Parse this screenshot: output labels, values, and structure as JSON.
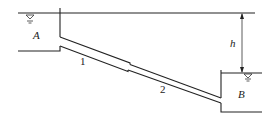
{
  "diagram": {
    "type": "hydraulics-pipe-system",
    "reservoir_upper": {
      "label": "A"
    },
    "reservoir_lower": {
      "label": "B"
    },
    "pipe_segments": [
      {
        "label": "1"
      },
      {
        "label": "2"
      }
    ],
    "head_difference": {
      "label": "h"
    },
    "water_surface_symbol": "▽",
    "colors": {
      "line": "#222222",
      "background": "#ffffff"
    }
  }
}
